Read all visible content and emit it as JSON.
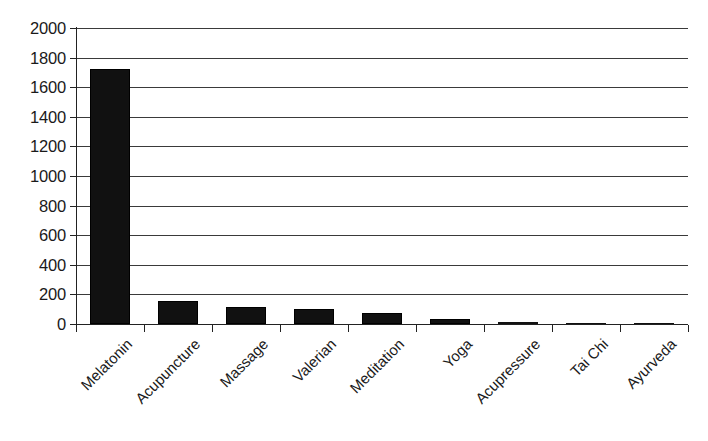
{
  "chart_data": {
    "type": "bar",
    "title": "",
    "subtitle": "",
    "xlabel": "",
    "ylabel": "",
    "categories": [
      "Melatonin",
      "Acupuncture",
      "Massage",
      "Valerian",
      "Meditation",
      "Yoga",
      "Acupressure",
      "Tai Chi",
      "Ayurveda"
    ],
    "values": [
      1720,
      155,
      115,
      100,
      75,
      35,
      12,
      8,
      2
    ],
    "ylim": [
      0,
      2000
    ],
    "ytick_step": 200,
    "yticks": [
      0,
      200,
      400,
      600,
      800,
      1000,
      1200,
      1400,
      1600,
      1800,
      2000
    ],
    "ytick_labels": [
      "0",
      "200",
      "400",
      "600",
      "800",
      "1000",
      "1200",
      "1400",
      "1600",
      "1800",
      "2000"
    ],
    "grid": true,
    "grid_axis": "y",
    "legend": false,
    "legend_position": "none",
    "bar_color": "#111111",
    "grid_color": "#3a3a3a",
    "axis_color": "#222222",
    "background_color": "#ffffff",
    "category_label_rotation": -45
  }
}
